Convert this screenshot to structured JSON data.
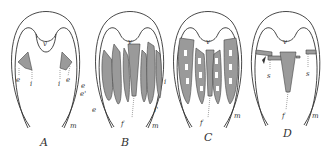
{
  "figure": {
    "panels": [
      {
        "id": "A",
        "caption": "A",
        "labels": [
          "v",
          "e",
          "i",
          "i",
          "e",
          "e",
          "m"
        ]
      },
      {
        "id": "B",
        "caption": "B",
        "labels": [
          "v",
          "e'",
          "e",
          "f",
          "i",
          "i'",
          "m"
        ]
      },
      {
        "id": "C",
        "caption": "C",
        "labels": [
          "v",
          "f",
          "m"
        ]
      },
      {
        "id": "D",
        "caption": "D",
        "labels": [
          "v",
          "s",
          "s",
          "f",
          "m"
        ]
      }
    ]
  },
  "colors": {
    "line": "#333333",
    "shade": "#9a9a9a",
    "background": "#ffffff"
  }
}
